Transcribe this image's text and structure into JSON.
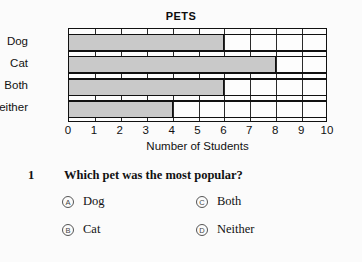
{
  "chart_data": {
    "type": "bar",
    "orientation": "horizontal",
    "title": "PETS",
    "categories": [
      "Dog",
      "Cat",
      "Both",
      "Neither"
    ],
    "values": [
      6,
      8,
      6,
      4
    ],
    "xlabel": "Number of Students",
    "ylabel": "",
    "xlim": [
      0,
      10
    ],
    "xticks": [
      "0",
      "1",
      "2",
      "3",
      "4",
      "5",
      "6",
      "7",
      "8",
      "9",
      "10"
    ],
    "grid": true,
    "legend": "none",
    "bar_color": "#c9c9c9",
    "border_color": "#111111"
  },
  "question": {
    "number": "1",
    "text": "Which pet was the most popular?",
    "options": [
      {
        "letter": "A",
        "label": "Dog"
      },
      {
        "letter": "B",
        "label": "Cat"
      },
      {
        "letter": "C",
        "label": "Both"
      },
      {
        "letter": "D",
        "label": "Neither"
      }
    ]
  }
}
